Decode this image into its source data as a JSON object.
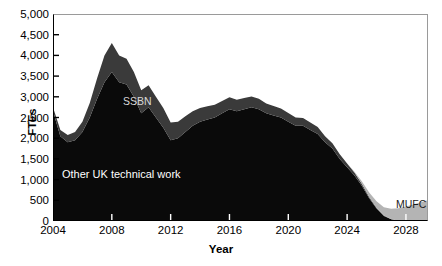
{
  "axes": {
    "ylabel": "FTEs",
    "xlabel": "Year",
    "yticks": [
      "0",
      "500",
      "1,000",
      "1,500",
      "2,000",
      "2,500",
      "3,000",
      "3,500",
      "4,000",
      "4,500",
      "5,000"
    ],
    "xticks": [
      "2004",
      "2008",
      "2012",
      "2016",
      "2020",
      "2024",
      "2028"
    ]
  },
  "labels": {
    "ssbn": "SSBN",
    "other": "Other UK technical work",
    "mufc": "MUFC"
  },
  "colors": {
    "other": "#0a0a0a",
    "ssbn": "#3a3a3a",
    "mufc": "#b4b4b4",
    "frame": "#000000",
    "background": "#ffffff"
  },
  "chart_data": {
    "type": "area",
    "stacked": true,
    "title": "",
    "xlabel": "Year",
    "ylabel": "FTEs",
    "xlim": [
      2004,
      2029.5
    ],
    "ylim": [
      0,
      5000
    ],
    "ytick_step": 500,
    "xtick_step": 4,
    "grid": false,
    "legend": "inline-annotations",
    "x": [
      2004,
      2004.5,
      2005,
      2005.5,
      2006,
      2006.5,
      2007,
      2007.5,
      2008,
      2008.5,
      2009,
      2009.5,
      2010,
      2010.5,
      2011,
      2011.5,
      2012,
      2012.5,
      2013,
      2013.5,
      2014,
      2014.5,
      2015,
      2015.5,
      2016,
      2016.5,
      2017,
      2017.5,
      2018,
      2018.5,
      2019,
      2019.5,
      2020,
      2020.5,
      2021,
      2021.5,
      2022,
      2022.5,
      2023,
      2023.5,
      2024,
      2024.5,
      2025,
      2025.5,
      2026,
      2026.5,
      2027,
      2027.5,
      2028,
      2028.5,
      2029,
      2029.5
    ],
    "series": [
      {
        "name": "Other UK technical work",
        "color": "#0a0a0a",
        "values": [
          2650,
          2050,
          1900,
          1950,
          2150,
          2500,
          2950,
          3350,
          3600,
          3350,
          3300,
          3000,
          2600,
          2750,
          2500,
          2250,
          1950,
          2000,
          2150,
          2300,
          2400,
          2450,
          2500,
          2600,
          2700,
          2650,
          2700,
          2750,
          2700,
          2600,
          2550,
          2500,
          2400,
          2300,
          2300,
          2200,
          2100,
          1900,
          1750,
          1500,
          1300,
          1100,
          850,
          550,
          300,
          120,
          40,
          10,
          0,
          0,
          0,
          0
        ]
      },
      {
        "name": "SSBN",
        "color": "#3a3a3a",
        "values": [
          100,
          150,
          180,
          200,
          250,
          350,
          500,
          650,
          700,
          650,
          620,
          600,
          560,
          530,
          500,
          480,
          430,
          400,
          380,
          350,
          330,
          320,
          310,
          300,
          290,
          280,
          270,
          260,
          250,
          240,
          230,
          220,
          210,
          200,
          190,
          180,
          170,
          150,
          130,
          110,
          90,
          70,
          50,
          30,
          20,
          10,
          5,
          0,
          0,
          0,
          0,
          0
        ]
      },
      {
        "name": "MUFC",
        "color": "#b4b4b4",
        "values": [
          0,
          0,
          0,
          0,
          0,
          0,
          0,
          0,
          0,
          0,
          0,
          0,
          0,
          0,
          0,
          0,
          0,
          0,
          0,
          0,
          0,
          0,
          0,
          0,
          0,
          0,
          0,
          0,
          0,
          0,
          0,
          0,
          0,
          0,
          0,
          0,
          0,
          0,
          0,
          0,
          0,
          20,
          60,
          110,
          160,
          200,
          250,
          300,
          350,
          400,
          450,
          500
        ]
      }
    ]
  }
}
